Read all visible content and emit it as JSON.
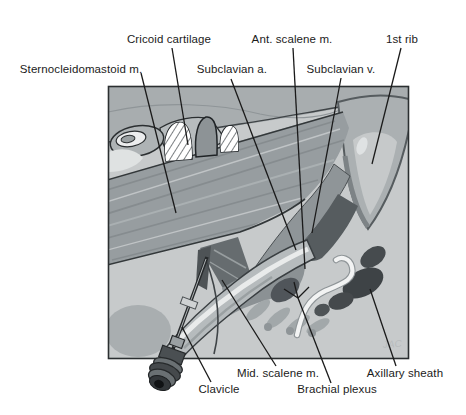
{
  "figure": {
    "labels": {
      "cricoid_cartilage": "Cricoid cartilage",
      "ant_scalene": "Ant. scalene m.",
      "first_rib": "1st rib",
      "sternocleidomastoid": "Sternocleidomastoid m.",
      "subclavian_a": "Subclavian a.",
      "subclavian_v": "Subclavian v.",
      "mid_scalene": "Mid. scalene m.",
      "brachial_plexus": "Brachial plexus",
      "clavicle": "Clavicle",
      "axillary_sheath": "Axillary sheath"
    },
    "signature": "JAC",
    "colors": {
      "page_background": "#ffffff",
      "frame_border": "#2b2f31",
      "panel_background": "#c7cacb",
      "muscle_gray": "#979da0",
      "bone_gray": "#b6bbbd",
      "vessel_dark": "#565c5f",
      "sheath_dark": "#3e4346",
      "leader_line": "#1a1a1a"
    }
  }
}
